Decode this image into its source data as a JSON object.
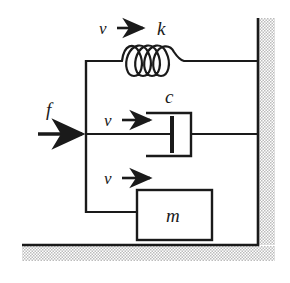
{
  "figure": {
    "background_color": "#ffffff",
    "line_color": "#1a1a1a",
    "hatch_color": "#b9b9b9"
  },
  "labels": {
    "force": "f",
    "spring_stiffness": "k",
    "damping_coefficient": "c",
    "mass": "m",
    "velocity_spring": "v",
    "velocity_damper": "v",
    "velocity_mass": "v"
  },
  "elements": {
    "spring": {
      "name": "spring",
      "symbol": "k",
      "coil_count": 4,
      "x_start": 86,
      "x_end": 258,
      "y": 61
    },
    "damper": {
      "name": "damper",
      "symbol": "c",
      "x_start": 86,
      "x_end": 258,
      "y": 134
    },
    "mass": {
      "name": "mass-block",
      "symbol": "m",
      "x": 137,
      "y": 190,
      "width": 75,
      "height": 50
    },
    "wall": {
      "name": "fixed-wall",
      "orientation": "vertical-right",
      "x": 258
    },
    "ground": {
      "name": "fixed-ground",
      "orientation": "horizontal-bottom",
      "y": 245
    },
    "input_force": {
      "name": "input-force-arrow",
      "symbol": "f",
      "direction": "right",
      "y": 134
    }
  }
}
